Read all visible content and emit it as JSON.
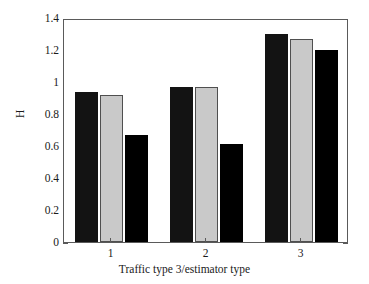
{
  "chart_data": {
    "type": "bar",
    "title": "",
    "subtitle": "",
    "xlabel": "Traffic type 3/estimator type",
    "ylabel": "H",
    "categories": [
      "1",
      "2",
      "3"
    ],
    "series": [
      {
        "name": "estimator-1",
        "color": "#131313",
        "style": "dark-fill",
        "values": [
          0.94,
          0.97,
          1.3
        ]
      },
      {
        "name": "estimator-2",
        "color": "#c9c9c9",
        "style": "gray-fill",
        "values": [
          0.92,
          0.97,
          1.27
        ]
      },
      {
        "name": "estimator-3",
        "color": "#000000",
        "style": "black-fill",
        "values": [
          0.67,
          0.61,
          1.2
        ]
      }
    ],
    "ylim": [
      0,
      1.4
    ],
    "yticks": [
      0,
      0.2,
      0.4,
      0.6,
      0.8,
      1,
      1.2,
      1.4
    ],
    "ytick_labels": [
      "0",
      "0.2",
      "0.4",
      "0.6",
      "0.8",
      "1",
      "1.2",
      "1.4"
    ],
    "xtick_labels": [
      "1",
      "2",
      "3"
    ],
    "grid": false,
    "legend": false,
    "legend_position": "none",
    "frame": true
  },
  "colors": {
    "background": "#ffffff",
    "axis": "#5a5a5a",
    "text": "#1a1a1a",
    "series_dark": "#131313",
    "series_gray": "#c9c9c9",
    "series_black": "#000000"
  }
}
